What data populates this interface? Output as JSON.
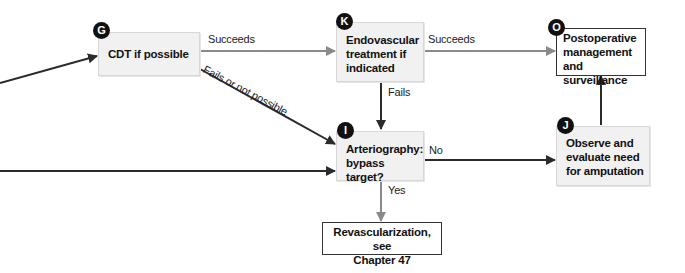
{
  "diagram": {
    "type": "flowchart",
    "colors": {
      "dark_edge": "#2b2b2b",
      "gray_edge": "#8a8a8a",
      "node_fill": "#f1f1f1",
      "badge": "#111111"
    },
    "nodes": {
      "G": {
        "badge": "G",
        "lines": [
          "CDT if possible"
        ]
      },
      "K": {
        "badge": "K",
        "lines": [
          "Endovascular",
          "treatment if",
          "indicated"
        ]
      },
      "O": {
        "badge": "O",
        "lines": [
          "Postoperative",
          "management",
          "and surveillance"
        ]
      },
      "I": {
        "badge": "I",
        "lines": [
          "Arteriography:",
          "bypass target?"
        ]
      },
      "J": {
        "badge": "J",
        "lines": [
          "Observe and",
          "evaluate need",
          "for amputation"
        ]
      },
      "R": {
        "lines": [
          "Revascularization, see",
          "Chapter 47"
        ]
      }
    },
    "edges": [
      {
        "from": "offscreen-left-upper",
        "to": "G",
        "label": ""
      },
      {
        "from": "offscreen-left-lower",
        "to": "I",
        "label": ""
      },
      {
        "from": "G",
        "to": "K",
        "label": "Succeeds"
      },
      {
        "from": "G",
        "to": "I",
        "label": "Fails or not possible"
      },
      {
        "from": "K",
        "to": "O",
        "label": "Succeeds"
      },
      {
        "from": "K",
        "to": "I",
        "label": "Fails"
      },
      {
        "from": "I",
        "to": "J",
        "label": "No"
      },
      {
        "from": "I",
        "to": "R",
        "label": "Yes"
      },
      {
        "from": "J",
        "to": "O",
        "label": ""
      }
    ]
  }
}
